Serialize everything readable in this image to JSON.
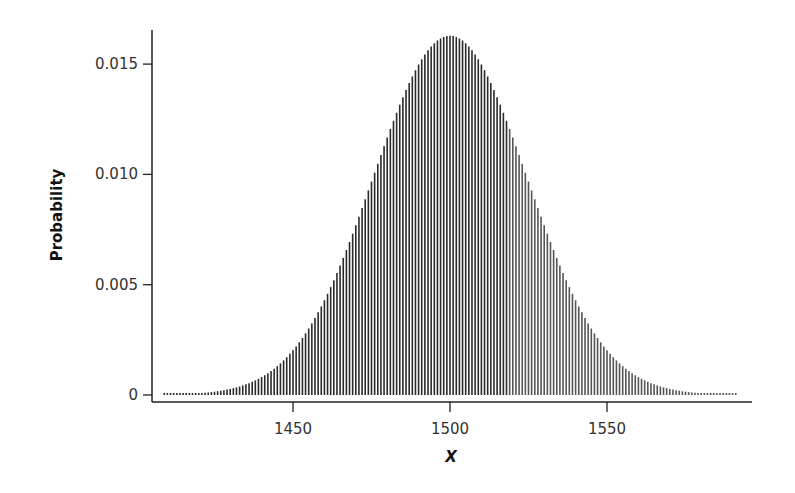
{
  "chart_data": {
    "type": "bar",
    "title": "",
    "xlabel": "X",
    "ylabel": "Probability",
    "xlim": [
      1404,
      1600
    ],
    "ylim": [
      0,
      0.0165
    ],
    "x_ticks": [
      1450,
      1500,
      1550
    ],
    "y_ticks": [
      0,
      0.005,
      0.01,
      0.015
    ],
    "y_tick_labels": [
      "0",
      "0.005",
      "0.010",
      "0.015"
    ],
    "x_tick_labels": [
      "1450",
      "1500",
      "1550"
    ],
    "grid": false,
    "legend": null,
    "distribution": {
      "description": "Discrete approximately normal (binomial-like) probability distribution, one bar per integer X",
      "x_start": 1409,
      "x_end": 1591,
      "step": 1,
      "mean": 1500,
      "sd": 24.5,
      "peak_value": 0.0163
    },
    "series": [
      {
        "name": "P(X)",
        "x": [
          1410,
          1420,
          1430,
          1440,
          1450,
          1460,
          1470,
          1480,
          1490,
          1500,
          1510,
          1520,
          1530,
          1540,
          1550,
          1560,
          1570,
          1580,
          1590
        ],
        "values": [
          2e-05,
          7e-05,
          0.00027,
          0.00081,
          0.002,
          0.00428,
          0.00768,
          0.01168,
          0.01501,
          0.01628,
          0.01501,
          0.01168,
          0.00768,
          0.00428,
          0.002,
          0.00081,
          0.00027,
          7e-05,
          2e-05
        ]
      }
    ],
    "colors": {
      "bars": "#2a2a2a",
      "axes": "#222222",
      "background": "#ffffff"
    }
  }
}
